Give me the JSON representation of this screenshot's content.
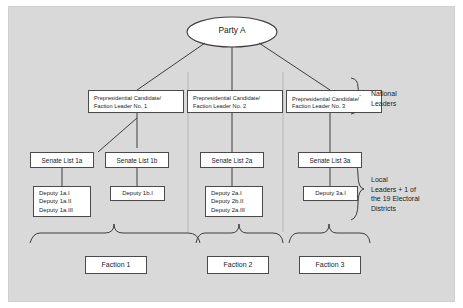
{
  "diagram": {
    "root": {
      "label": "Party A",
      "shape": "ellipse"
    },
    "candidates": [
      {
        "line1": "Prepresidential Candidate/",
        "line2": "Faction Leader No. 1",
        "marker": ""
      },
      {
        "line1": "Prepresidential Candidate/",
        "line2": "Faction Leader No. 2",
        "marker": ""
      },
      {
        "line1": "Prepresidential Candidate/",
        "line2": "Faction Leader No.   3",
        "marker": "*"
      }
    ],
    "senate_lists": [
      {
        "label": "Senate List 1a"
      },
      {
        "label": "Senate List 1b"
      },
      {
        "label": "Senate List 2a"
      },
      {
        "label": "Senate List 3a"
      }
    ],
    "deputy_groups": [
      {
        "lines": [
          "Deputy 1a.I",
          "Deputy 1a.II",
          "Deputy 1a.III"
        ]
      },
      {
        "lines": [
          "Deputy 1b.I"
        ]
      },
      {
        "lines": [
          "Deputy 2a.I",
          "Deputy 2b.II",
          "Deputy 2a.III"
        ]
      },
      {
        "lines": [
          "Deputy 3a.I"
        ]
      }
    ],
    "factions": [
      {
        "label": "Faction 1"
      },
      {
        "label": "Faction 2"
      },
      {
        "label": "Faction 3"
      }
    ],
    "annotations": {
      "national": [
        "National",
        "Leaders"
      ],
      "local": [
        "Local",
        "Leaders + 1 of",
        "the 19 Electoral",
        "Districts"
      ]
    },
    "colors": {
      "panel_background": "#d9d9d9",
      "node_fill": "#ffffff",
      "node_border": "#4a4a4a",
      "connector": "#3d3d3d",
      "divider": "#c2c2c2",
      "text": "#1a1a1a"
    }
  }
}
